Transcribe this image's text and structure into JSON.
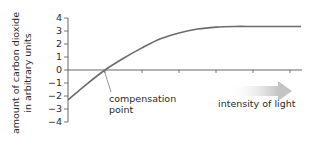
{
  "chart_data": {
    "type": "line",
    "title": "",
    "xlabel": "intensity of light",
    "ylabel": "amount of carbon dioxide in arbitrary units",
    "ylabel_lines": [
      "amount of carbon dioxide",
      "in arbitrary units"
    ],
    "yticks": [
      4,
      3,
      2,
      1,
      0,
      -1,
      -2,
      -3,
      -4
    ],
    "ytick_labels": [
      "4",
      "3",
      "2",
      "1",
      "0",
      "−1",
      "−2",
      "−3",
      "−4"
    ],
    "ylim": [
      -4,
      4
    ],
    "xticks_count": 6,
    "x_tick_labels": [],
    "grid": false,
    "series": [
      {
        "name": "CO2 uptake",
        "x": [
          0,
          0.5,
          1,
          1.5,
          2,
          2.5,
          3,
          3.5,
          4,
          4.5,
          5,
          5.5,
          6,
          6.3
        ],
        "values": [
          -2.3,
          -1.1,
          0.0,
          0.9,
          1.7,
          2.4,
          2.85,
          3.15,
          3.3,
          3.35,
          3.35,
          3.35,
          3.35,
          3.35
        ]
      }
    ],
    "annotations": [
      {
        "text": "compensation point",
        "lines": [
          "compensation",
          "point"
        ],
        "x": 1,
        "y": 0
      },
      {
        "text": "intensity of light",
        "arrow": "right"
      }
    ],
    "colors": {
      "line": "#6b6b6b",
      "axis": "#555555",
      "arrow": "#c9c9c9"
    }
  }
}
